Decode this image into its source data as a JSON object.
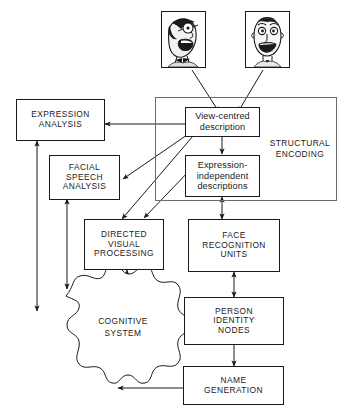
{
  "diagram": {
    "stroke_color": "#1a1a1a",
    "group_stroke_color": "#6b6b6b",
    "background_color": "#ffffff"
  },
  "photos": [
    {
      "name": "face-photo-left",
      "alt": "cartoon face three-quarter view, laughing"
    },
    {
      "name": "face-photo-right",
      "alt": "cartoon face frontal view, smiling"
    }
  ],
  "group": {
    "label": "STRUCTURAL\nENCODING"
  },
  "nodes": [
    {
      "id": "expression_analysis",
      "label": "EXPRESSION\nANALYSIS"
    },
    {
      "id": "facial_speech_analysis",
      "label": "FACIAL\nSPEECH\nANALYSIS"
    },
    {
      "id": "directed_visual_processing",
      "label": "DIRECTED\nVISUAL\nPROCESSING"
    },
    {
      "id": "view_centred_description",
      "label": "View-centred\ndescription"
    },
    {
      "id": "expression_independent",
      "label": "Expression-\nindependent\ndescriptions"
    },
    {
      "id": "face_recognition_units",
      "label": "FACE\nRECOGNITION\nUNITS"
    },
    {
      "id": "person_identity_nodes",
      "label": "PERSON\nIDENTITY\nNODES"
    },
    {
      "id": "name_generation",
      "label": "NAME\nGENERATION"
    },
    {
      "id": "cognitive_system",
      "label": "COGNITIVE\nSYSTEM"
    }
  ],
  "edges": [
    {
      "from": "face-photo-left",
      "to": "view_centred_description",
      "arrow": "single"
    },
    {
      "from": "face-photo-right",
      "to": "view_centred_description",
      "arrow": "single"
    },
    {
      "from": "view_centred_description",
      "to": "expression_analysis",
      "arrow": "single"
    },
    {
      "from": "view_centred_description",
      "to": "facial_speech_analysis",
      "arrow": "single"
    },
    {
      "from": "view_centred_description",
      "to": "directed_visual_processing",
      "arrow": "single"
    },
    {
      "from": "view_centred_description",
      "to": "expression_independent",
      "arrow": "single"
    },
    {
      "from": "expression_independent",
      "to": "directed_visual_processing",
      "arrow": "single"
    },
    {
      "from": "expression_independent",
      "to": "face_recognition_units",
      "arrow": "double"
    },
    {
      "from": "face_recognition_units",
      "to": "person_identity_nodes",
      "arrow": "double"
    },
    {
      "from": "person_identity_nodes",
      "to": "name_generation",
      "arrow": "single"
    },
    {
      "from": "person_identity_nodes",
      "to": "cognitive_system",
      "arrow": "double"
    },
    {
      "from": "name_generation",
      "to": "cognitive_system",
      "arrow": "single"
    },
    {
      "from": "cognitive_system",
      "to": "expression_analysis",
      "arrow": "double"
    },
    {
      "from": "cognitive_system",
      "to": "facial_speech_analysis",
      "arrow": "double"
    },
    {
      "from": "cognitive_system",
      "to": "directed_visual_processing",
      "arrow": "double"
    }
  ]
}
